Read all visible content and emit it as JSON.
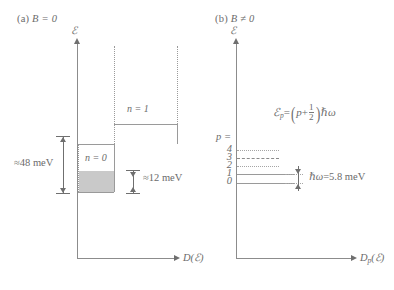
{
  "figure": {
    "panel_a": {
      "caption": "(a) B = 0",
      "caption_paren": "(a)",
      "caption_expr": "B = 0",
      "y_axis_label": "ℰ",
      "x_axis_label": "D(ℰ)",
      "bands": [
        {
          "id": "n1",
          "label": "n = 1"
        },
        {
          "id": "n0",
          "label": "n = 0"
        }
      ],
      "measurements": [
        {
          "id": "gap-48",
          "label": "≈48 meV",
          "value": 48,
          "unit": "meV",
          "symbol": "≈"
        },
        {
          "id": "fill-12",
          "label": "≈12 meV",
          "value": 12,
          "unit": "meV",
          "symbol": "≈"
        }
      ]
    },
    "panel_b": {
      "caption": "(b) B ≠ 0",
      "caption_paren": "(b)",
      "caption_expr": "B ≠ 0",
      "y_axis_label": "ℰ",
      "x_axis_label": "Dₚ(ℰ)",
      "x_axis_label_base": "D",
      "x_axis_label_sub": "p",
      "x_axis_label_arg": "(ℰ)",
      "levels_header": "p =",
      "levels": [
        {
          "index": "4",
          "style": "dotted"
        },
        {
          "index": "3",
          "style": "dashed"
        },
        {
          "index": "2",
          "style": "dotted"
        },
        {
          "index": "1",
          "style": "solid"
        },
        {
          "index": "0",
          "style": "solid"
        }
      ],
      "formula": {
        "lhs_base": "ℰ",
        "lhs_sub": "p",
        "equals": "=",
        "open_paren": "(",
        "p_term": "p",
        "plus": "+",
        "frac_num": "1",
        "frac_den": "2",
        "close_paren": ")",
        "hbar_omega": "ℏω",
        "full": "ℰₚ = (p + 1/2)ℏω"
      },
      "spacing": {
        "label": "ℏω = 5.8 meV",
        "symbol": "ℏω",
        "equals": "=",
        "value": "5.8",
        "unit": "meV"
      }
    }
  },
  "colors": {
    "axis": "#8c8c8c",
    "text": "#6b6b6b",
    "shaded_band": "#c9c9c9",
    "level_line": "#9a9a9a",
    "background": "#ffffff"
  }
}
